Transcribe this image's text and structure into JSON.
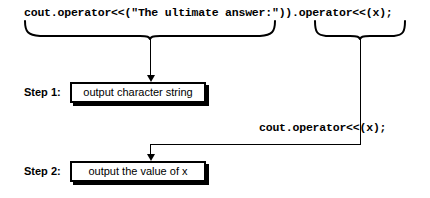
{
  "diagram": {
    "code_lines": {
      "top": "cout.operator<<(\"The ultimate answer:\")).operator<<(x);",
      "middle": "cout.operator<<(x);"
    },
    "steps": [
      {
        "label": "Step 1:",
        "box_text": "output character string"
      },
      {
        "label": "Step 2:",
        "box_text": "output the value of x"
      }
    ],
    "icons": {
      "brace_left": "curly-brace-under-icon",
      "brace_right": "curly-brace-under-icon",
      "arrow_step1": "arrow-down-icon",
      "arrow_step2": "arrow-down-icon"
    },
    "colors": {
      "ink": "#000000",
      "background": "#ffffff"
    }
  }
}
